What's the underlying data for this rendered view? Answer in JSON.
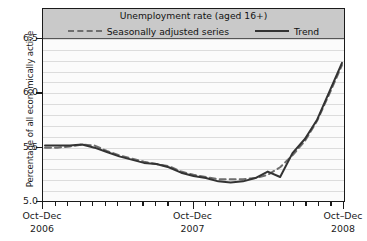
{
  "chart_data": {
    "type": "line",
    "title": "Unemployment rate (aged 16+)",
    "xlabel": "",
    "ylabel": "Percentage of all economically active",
    "ylim": [
      5.0,
      6.5
    ],
    "yticks": [
      5.0,
      5.5,
      6.0,
      6.5
    ],
    "ytick_labels": [
      "5.0",
      "5.5",
      "6.0",
      "6.5"
    ],
    "grid": true,
    "grid_orientation": "horizontal",
    "legend_position": "top-inside",
    "xtick_labels": [
      {
        "period": "Oct–Dec",
        "year": "2006"
      },
      {
        "period": "Oct–Dec",
        "year": "2007"
      },
      {
        "period": "Oct–Dec",
        "year": "2008"
      }
    ],
    "x_minor_tick_count": 24,
    "x": [
      0,
      1,
      2,
      3,
      4,
      5,
      6,
      7,
      8,
      9,
      10,
      11,
      12,
      13,
      14,
      15,
      16,
      17,
      18,
      19,
      20,
      21,
      22,
      23,
      24
    ],
    "series": [
      {
        "name": "Seasonally adjusted series",
        "style": "dashed",
        "color": "#6e6e6e",
        "values": [
          5.5,
          5.5,
          5.51,
          5.53,
          5.52,
          5.47,
          5.43,
          5.4,
          5.37,
          5.35,
          5.33,
          5.28,
          5.25,
          5.23,
          5.21,
          5.21,
          5.21,
          5.22,
          5.25,
          5.32,
          5.43,
          5.56,
          5.75,
          6.0,
          6.26
        ]
      },
      {
        "name": "Trend",
        "style": "solid",
        "color": "#333333",
        "values": [
          5.52,
          5.52,
          5.52,
          5.53,
          5.5,
          5.46,
          5.42,
          5.39,
          5.36,
          5.35,
          5.32,
          5.27,
          5.24,
          5.22,
          5.19,
          5.18,
          5.19,
          5.22,
          5.28,
          5.23,
          5.45,
          5.58,
          5.76,
          6.02,
          6.28
        ]
      }
    ]
  },
  "legend": {
    "entries": [
      {
        "label": "Seasonally adjusted series",
        "swatch": "dashed-line-swatch"
      },
      {
        "label": "Trend",
        "swatch": "solid-line-swatch"
      }
    ]
  },
  "colors": {
    "header_band": "#c9c9c9",
    "plot_background": "#fbfbfb",
    "gridline": "#dcdcdc",
    "axis": "#1a1a1a",
    "dashed_series": "#6e6e6e",
    "solid_series": "#333333"
  }
}
